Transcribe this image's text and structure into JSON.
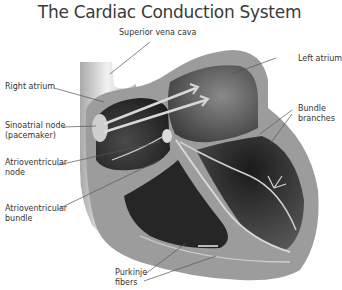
{
  "title": "The Cardiac Conduction System",
  "labels": {
    "superior_vena_cava": "Superior vena cava",
    "right_atrium": "Right atrium",
    "sinoatrial_node_1": "Sinoatrial node",
    "sinoatrial_node_2": "(pacemaker)",
    "av_node_1": "Atrioventricular",
    "av_node_2": "node",
    "av_bundle_1": "Atrioventricular",
    "av_bundle_2": "bundle",
    "purkinje_1": "Purkinje",
    "purkinje_2": "fibers",
    "left_atrium": "Left atrium",
    "bundle_branches_1": "Bundle",
    "bundle_branches_2": "branches"
  },
  "colors": {
    "wall_light": "#c9c9c9",
    "wall_mid": "#9a9a9a",
    "chamber_dark": "#2a2a2a",
    "pathway": "#d8d8d8",
    "leader_line": "#555555"
  }
}
